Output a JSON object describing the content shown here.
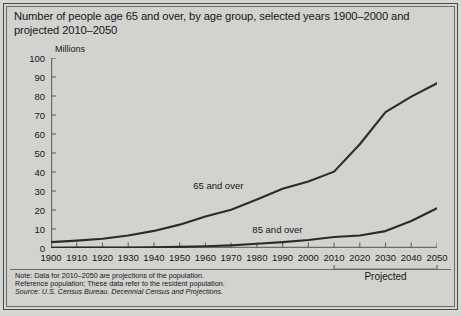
{
  "title": "Number of people age 65 and over, by age group, selected years 1900–2000 and projected 2010–2050",
  "unit_label": "Millions",
  "footnotes": [
    "Note: Data for 2010–2050 are projections of the population.",
    "Reference population; These data refer to the resident population.",
    "Source: U.S. Census Bureau. Decennial Census and Projections."
  ],
  "projected_label": "Projected",
  "projected_range": [
    2010,
    2050
  ],
  "colors": {
    "background": "#d2d2ce",
    "frame": "#6b6b68",
    "line": "#2b2b2e",
    "text": "#16161a"
  },
  "chart_data": {
    "type": "line",
    "title": "Number of people age 65 and over, by age group, selected years 1900–2000 and projected 2010–2050",
    "xlabel": "",
    "ylabel": "Millions",
    "xlim": [
      1900,
      2050
    ],
    "ylim": [
      0,
      100
    ],
    "ytick_labels": [
      "0",
      "10",
      "20",
      "30",
      "40",
      "50",
      "60",
      "70",
      "80",
      "90",
      "100"
    ],
    "yticks": [
      0,
      10,
      20,
      30,
      40,
      50,
      60,
      70,
      80,
      90,
      100
    ],
    "x": [
      1900,
      1910,
      1920,
      1930,
      1940,
      1950,
      1960,
      1970,
      1980,
      1990,
      2000,
      2010,
      2020,
      2030,
      2040,
      2050
    ],
    "xtick_labels": [
      "1900",
      "1910",
      "1920",
      "1930",
      "1940",
      "1950",
      "1960",
      "1970",
      "1980",
      "1990",
      "2000",
      "2010",
      "2020",
      "2030",
      "2040",
      "2050"
    ],
    "grid": false,
    "legend": "inline-annotations",
    "series": [
      {
        "name": "65 and over",
        "label": "65 and over",
        "label_x": 1965,
        "label_y": 33,
        "values": [
          3.1,
          3.9,
          4.9,
          6.6,
          9.0,
          12.3,
          16.6,
          20.1,
          25.5,
          31.2,
          35.0,
          40.2,
          54.6,
          71.5,
          79.7,
          86.7
        ]
      },
      {
        "name": "85 and over",
        "label": "85 and over",
        "label_x": 1988,
        "label_y": 10,
        "values": [
          0.1,
          0.2,
          0.2,
          0.3,
          0.4,
          0.6,
          0.9,
          1.4,
          2.2,
          3.1,
          4.2,
          5.8,
          6.6,
          8.9,
          14.2,
          20.9
        ]
      }
    ]
  }
}
